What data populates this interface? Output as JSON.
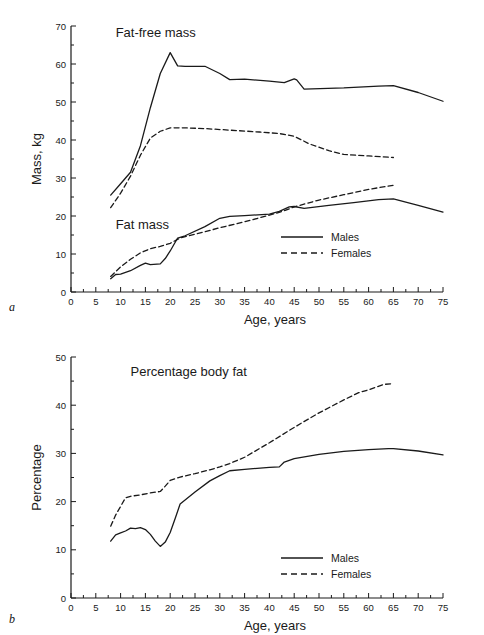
{
  "figure": {
    "panels": [
      {
        "letter": "a",
        "annotations": [
          "Fat-free mass",
          "Fat mass"
        ],
        "xlabel": "Age, years",
        "ylabel": "Mass, kg"
      },
      {
        "letter": "b",
        "annotations": [
          "Percentage body fat"
        ],
        "xlabel": "Age, years",
        "ylabel": "Percentage"
      }
    ],
    "legend": {
      "males_label": "Males",
      "females_label": "Females"
    },
    "line_color": "#1a1a1a"
  },
  "chart_data": [
    {
      "type": "line",
      "title": "Fat-free mass and Fat mass",
      "panel": "a",
      "xlabel": "Age, years",
      "ylabel": "Mass, kg",
      "xlim": [
        0,
        75
      ],
      "ylim": [
        0,
        70
      ],
      "xticks": [
        0,
        5,
        10,
        15,
        20,
        25,
        30,
        35,
        40,
        45,
        50,
        55,
        60,
        65,
        70,
        75
      ],
      "yticks": [
        0,
        10,
        20,
        30,
        40,
        50,
        60,
        70
      ],
      "minor_xtick_step": 2.5,
      "minor_ytick_step": 5,
      "grid": false,
      "legend_position": "lower right",
      "annotations": [
        {
          "text": "Fat-free mass",
          "x": 9,
          "y": 67
        },
        {
          "text": "Fat mass",
          "x": 9,
          "y": 16.5
        }
      ],
      "series": [
        {
          "name": "Males",
          "group": "Fat-free mass",
          "style": "solid",
          "x": [
            8,
            10,
            12,
            14,
            16,
            18,
            20,
            21.5,
            23,
            27,
            30,
            32,
            35,
            40,
            43,
            45,
            45.5,
            47,
            55,
            62,
            65,
            70,
            75
          ],
          "y": [
            25.5,
            28.5,
            31.5,
            38.5,
            48.5,
            57.5,
            63.0,
            59.5,
            59.4,
            59.4,
            57.5,
            55.9,
            56.0,
            55.5,
            55.1,
            56.1,
            55.8,
            53.4,
            53.7,
            54.2,
            54.3,
            52.5,
            50.2
          ]
        },
        {
          "name": "Females",
          "group": "Fat-free mass",
          "style": "dashed",
          "x": [
            8,
            10,
            12,
            14,
            16,
            18,
            20,
            23,
            27,
            32,
            38,
            42,
            45,
            48,
            52,
            55,
            60,
            65
          ],
          "y": [
            22.2,
            26.0,
            30.5,
            36.0,
            40.5,
            42.3,
            43.2,
            43.2,
            43.0,
            42.6,
            42.1,
            41.7,
            41.0,
            39.0,
            37.2,
            36.2,
            35.8,
            35.4
          ]
        },
        {
          "name": "Males",
          "group": "Fat mass",
          "style": "solid",
          "x": [
            8,
            9,
            10,
            12,
            14,
            15,
            16,
            18,
            19,
            20,
            21.5,
            23,
            27,
            30,
            32,
            35,
            40,
            42,
            44,
            45,
            47,
            52,
            57,
            62,
            65,
            70,
            75
          ],
          "y": [
            3.5,
            4.6,
            4.7,
            5.6,
            7.0,
            7.6,
            7.2,
            7.4,
            8.8,
            10.8,
            14.2,
            14.8,
            17.2,
            19.4,
            19.9,
            20.1,
            20.5,
            21.2,
            22.4,
            22.5,
            22.0,
            22.8,
            23.5,
            24.3,
            24.5,
            22.8,
            21.0
          ]
        },
        {
          "name": "Females",
          "group": "Fat mass",
          "style": "dashed",
          "x": [
            8,
            10,
            12,
            14,
            16,
            18,
            20,
            22,
            25,
            30,
            35,
            40,
            43,
            45,
            50,
            55,
            60,
            65
          ],
          "y": [
            4.1,
            6.6,
            8.6,
            10.3,
            11.4,
            12.0,
            12.8,
            14.2,
            15.2,
            16.9,
            18.5,
            20.2,
            21.4,
            22.4,
            24.2,
            25.6,
            27.0,
            28.1
          ]
        }
      ]
    },
    {
      "type": "line",
      "title": "Percentage body fat",
      "panel": "b",
      "xlabel": "Age, years",
      "ylabel": "Percentage",
      "xlim": [
        0,
        75
      ],
      "ylim": [
        0,
        50
      ],
      "xticks": [
        0,
        5,
        10,
        15,
        20,
        25,
        30,
        35,
        40,
        45,
        50,
        55,
        60,
        65,
        70,
        75
      ],
      "yticks": [
        0,
        10,
        20,
        30,
        40,
        50
      ],
      "minor_xtick_step": 2.5,
      "minor_ytick_step": 5,
      "grid": false,
      "legend_position": "lower right",
      "annotations": [
        {
          "text": "Percentage body fat",
          "x": 12,
          "y": 46
        }
      ],
      "series": [
        {
          "name": "Males",
          "group": "Percentage body fat",
          "style": "solid",
          "x": [
            8,
            9,
            10,
            11,
            12,
            13,
            14,
            15,
            16,
            17,
            18,
            19,
            20,
            21,
            22,
            25,
            28,
            30,
            32,
            35,
            40,
            42,
            43,
            45,
            50,
            55,
            60,
            64,
            65,
            70,
            75
          ],
          "y": [
            11.8,
            13.1,
            13.5,
            13.9,
            14.5,
            14.4,
            14.6,
            14.2,
            13.2,
            11.8,
            10.7,
            11.6,
            13.6,
            16.5,
            19.5,
            22.0,
            24.3,
            25.4,
            26.4,
            26.7,
            27.1,
            27.2,
            28.2,
            28.9,
            29.8,
            30.4,
            30.8,
            31.0,
            31.0,
            30.5,
            29.7
          ]
        },
        {
          "name": "Females",
          "group": "Percentage body fat",
          "style": "dashed",
          "x": [
            8,
            9,
            10,
            11,
            12,
            14,
            16,
            18,
            19,
            20,
            22,
            25,
            28,
            30,
            32,
            35,
            40,
            45,
            50,
            55,
            58,
            60,
            63,
            65
          ],
          "y": [
            14.9,
            17.2,
            19.0,
            20.8,
            21.1,
            21.4,
            21.8,
            22.1,
            23.2,
            24.4,
            25.1,
            25.8,
            26.6,
            27.2,
            27.9,
            29.2,
            32.2,
            35.4,
            38.4,
            41.1,
            42.6,
            43.2,
            44.3,
            44.5
          ]
        }
      ]
    }
  ]
}
